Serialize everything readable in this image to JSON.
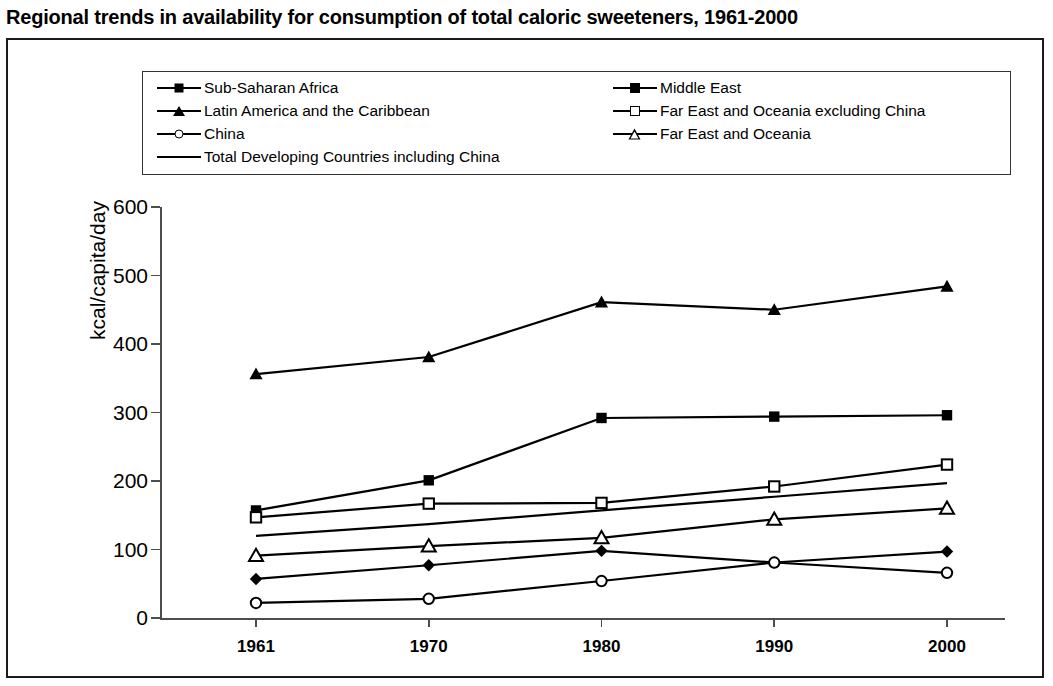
{
  "title": "Regional trends in availability for consumption of total caloric sweeteners, 1961-2000",
  "legend": {
    "entries": [
      {
        "label": "Sub-Saharan Africa",
        "marker": "filled-diamond",
        "column": 1,
        "row": 1
      },
      {
        "label": "Middle East",
        "marker": "filled-square",
        "column": 2,
        "row": 1
      },
      {
        "label": "Latin America and the Caribbean",
        "marker": "filled-triangle",
        "column": 1,
        "row": 2
      },
      {
        "label": "Far East and Oceania excluding China",
        "marker": "open-square",
        "column": 2,
        "row": 2
      },
      {
        "label": "China",
        "marker": "open-circle",
        "column": 1,
        "row": 3
      },
      {
        "label": "Far East and Oceania",
        "marker": "open-triangle",
        "column": 2,
        "row": 3
      },
      {
        "label": "Total Developing Countries including China",
        "marker": "line-only",
        "column": 1,
        "row": 4
      }
    ]
  },
  "axes": {
    "y_title": "kcal/capita/day",
    "y_ticks": [
      "0",
      "100",
      "200",
      "300",
      "400",
      "500",
      "600"
    ],
    "x_ticks": [
      "1961",
      "1970",
      "1980",
      "1990",
      "2000"
    ]
  },
  "chart_data": {
    "type": "line",
    "title": "Regional trends in availability for consumption of total caloric sweeteners, 1961-2000",
    "xlabel": "",
    "ylabel": "kcal/capita/day",
    "categories": [
      "1961",
      "1970",
      "1980",
      "1990",
      "2000"
    ],
    "ylim": [
      0,
      600
    ],
    "ytick_step": 100,
    "grid": false,
    "legend_position": "top-inside",
    "series": [
      {
        "name": "Sub-Saharan Africa",
        "marker": "filled-diamond",
        "values": [
          57,
          77,
          98,
          81,
          97
        ]
      },
      {
        "name": "Middle East",
        "marker": "filled-square",
        "values": [
          157,
          201,
          292,
          294,
          296
        ]
      },
      {
        "name": "Latin America and the Caribbean",
        "marker": "filled-triangle",
        "values": [
          356,
          381,
          461,
          450,
          484
        ]
      },
      {
        "name": "Far East and Oceania excluding China",
        "marker": "open-square",
        "values": [
          147,
          167,
          168,
          192,
          224
        ]
      },
      {
        "name": "China",
        "marker": "open-circle",
        "values": [
          22,
          28,
          54,
          81,
          66
        ]
      },
      {
        "name": "Far East and Oceania",
        "marker": "open-triangle",
        "values": [
          91,
          105,
          117,
          144,
          160
        ]
      },
      {
        "name": "Total Developing Countries including China",
        "marker": "line-only",
        "values": [
          120,
          137,
          157,
          177,
          197
        ]
      }
    ]
  }
}
